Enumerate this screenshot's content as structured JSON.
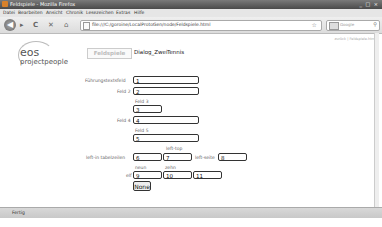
{
  "window": {
    "title": "Feldspiele - Mozilla Firefox",
    "controls": "_ □ ×"
  },
  "menu": [
    "Datei",
    "Bearbeiten",
    "Ansicht",
    "Chronik",
    "Lesezeichen",
    "Extras",
    "Hilfe"
  ],
  "nav": {
    "back": "◀",
    "forward": "▸",
    "reload": "C",
    "stop": "✕",
    "home": "⌂",
    "url": "file:///C:/goroine/LocalProtoGen/node/Feldspiele.html",
    "star": "☆",
    "search_placeholder": "Google",
    "search_icon": "⚲"
  },
  "top_link": "zurück | Feldspiele.html",
  "logo": {
    "line1": "eos",
    "line2": "projectpeople"
  },
  "tabs": [
    {
      "label": "Feldspiele",
      "active": true
    },
    {
      "label": "Dialog_Zwei",
      "active": false
    },
    {
      "label": "Tennis",
      "active": false
    }
  ],
  "form": {
    "fuehrungstext_label": "Führungstextsfeld",
    "fuehrungstext_value": "1",
    "feld2_label": "Feld 2",
    "feld2_value": "2",
    "feld3_label": "Feld 3",
    "feld3_value": "3",
    "feld4_label": "Feld 4",
    "feld4_value": "4",
    "feld5_label": "Feld 5",
    "feld5_value": "5",
    "left_top_label": "left-top",
    "left_tabelzeilen_label": "left-in tabelzeilen",
    "left_tabelzeilen_value": "6",
    "left_top_value": "7",
    "left_side_label": "left-seite",
    "left_side_value": "8",
    "neun_label": "neun",
    "zehn_label": "zehn",
    "elf_label": "elf",
    "neun_value": "9",
    "zehn_value": "10",
    "elf_value": "11",
    "button_label": "None"
  },
  "status": "Fertig"
}
